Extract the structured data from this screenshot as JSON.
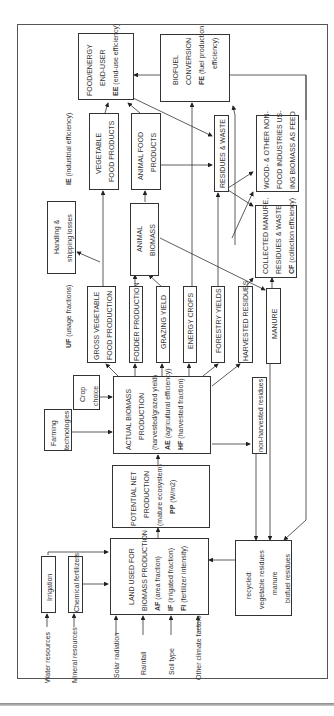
{
  "diagram": {
    "nodes": {
      "end_user": {
        "line1": "FOOD/ENERGY",
        "line2": "END-USER",
        "code": "EE",
        "param": "(end-use efficiency)"
      },
      "biofuel": {
        "line1": "BIOFUEL",
        "line2": "CONVERSION",
        "code": "FE",
        "param": "(fuel production",
        "param2": "efficiency)"
      },
      "veg_food": {
        "line1": "VEGETABLE",
        "line2": "FOOD PRODUCTS"
      },
      "animal_food": {
        "line1": "ANIMAL FOOD",
        "line2": "PRODUCTS"
      },
      "residues_waste": {
        "line1": "RESIDUES & WASTE"
      },
      "wood_industries": {
        "line1": "WOOD- & OTHER NON-",
        "line2": "FOOD INDUSTRIES US-",
        "line3": "ING BIOMASS AS FEED"
      },
      "collected_manure": {
        "line1": "COLLECTED MANURE,",
        "line2": "RESIDUES & WASTE",
        "code": "CF",
        "param": "(collection efficiency)"
      },
      "handling_losses": {
        "line1": "Handling &",
        "line2": "shipping losses"
      },
      "animal_biomass": {
        "line1": "ANIMAL",
        "line2": "BIOMASS"
      },
      "gross_veg": {
        "line1": "GROSS VEGETABLE",
        "line2": "FOOD PRODUCTION"
      },
      "fodder": {
        "line1": "FODDER PRODUCTION"
      },
      "grazing": {
        "line1": "GRAZING YIELD"
      },
      "energy_crops": {
        "line1": "ENERGY CROPS"
      },
      "forestry": {
        "line1": "FORESTRY YIELDS"
      },
      "harvested_residues": {
        "line1": "HARVESTED RESIDUES"
      },
      "manure": {
        "line1": "MANURE"
      },
      "crop_choice": {
        "line1": "Crop",
        "line2": "choice"
      },
      "farming_tech": {
        "line1": "Farming",
        "line2": "technologies"
      },
      "actual_biomass": {
        "line1": "ACTUAL BIOMASS",
        "line2": "PRODUCTION",
        "line3": "(harvested/grazed yield)",
        "code1": "AE",
        "param1": "(agricultural efficiency)",
        "code2": "HF",
        "param2": "(harvested fraction)"
      },
      "non_harvested": {
        "line1": "non-harvested residues"
      },
      "potential_net": {
        "line1": "POTENTIAL NET",
        "line2": "PRODUCTION",
        "line3": "(mature ecosystem)",
        "code": "PP",
        "param": "(W/m2)"
      },
      "land_used": {
        "line1": "LAND USED FOR",
        "line2": "BIOMASS PRODUCTION",
        "code1": "AF",
        "param1": "(area fraction)",
        "code2": "IF",
        "param2": "(irrigated fraction)",
        "code3": "FI",
        "param3": "(fertilizer intensity)"
      },
      "irrigation": {
        "line1": "Irrigation"
      },
      "chem_fert": {
        "line1": "Chemical fertilizers"
      },
      "recycled": {
        "line1": "recycled:",
        "line2": "vegetable residues",
        "line3": "manure",
        "line4": "biofuel residues"
      }
    },
    "labels": {
      "ie": {
        "code": "IE",
        "text": "(industrial efficiency)"
      },
      "uf": {
        "code": "UF",
        "text": "(usage fractions)"
      }
    },
    "inputs": [
      "Water resources",
      "Mineral resources",
      "Solar radiation",
      "Rainfall",
      "Soil type",
      "Other climate factors"
    ],
    "line_color": "#333333"
  }
}
